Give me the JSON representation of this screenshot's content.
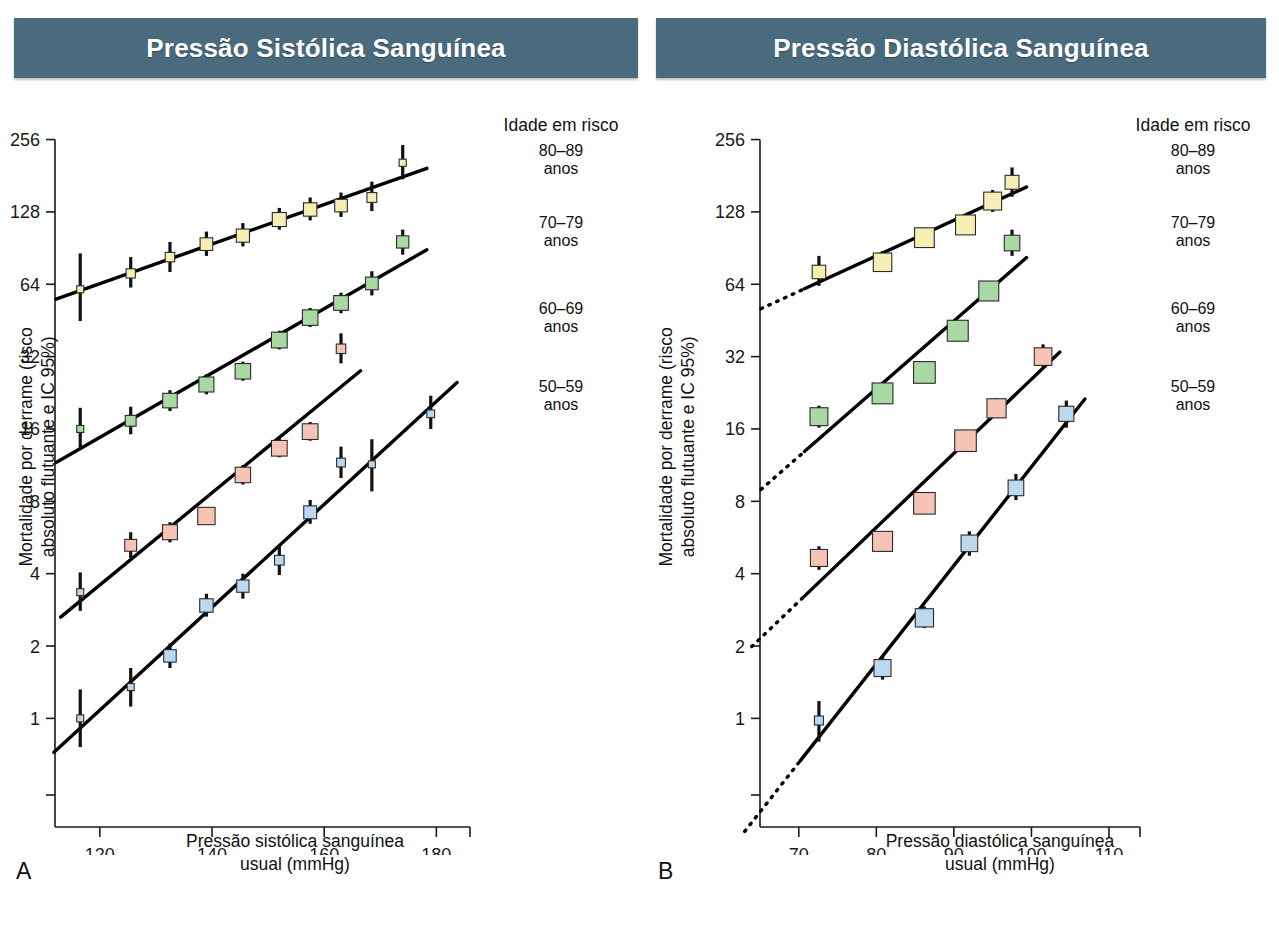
{
  "figure": {
    "panels": [
      {
        "id": "A",
        "letter": "A",
        "banner_title": "Pressão Sistólica Sanguínea",
        "xlabel_line1": "Pressão sistólica sanguínea",
        "xlabel_line2": "usual (mmHg)",
        "ylabel_line1": "Mortalidade por derrame (risco",
        "ylabel_line2": "absoluto flutuante e IC 95%)"
      },
      {
        "id": "B",
        "letter": "B",
        "banner_title": "Pressão Diastólica Sanguínea",
        "xlabel_line1": "Pressão diastólica sanguínea",
        "xlabel_line2": "usual (mmHg)",
        "ylabel_line1": "Mortalidade por derrame (risco",
        "ylabel_line2": "absoluto flutuante e IC 95%)"
      }
    ],
    "legend": {
      "title": "Idade em risco",
      "entries": [
        {
          "range": "80–89",
          "unit": "anos"
        },
        {
          "range": "70–79",
          "unit": "anos"
        },
        {
          "range": "60–69",
          "unit": "anos"
        },
        {
          "range": "50–59",
          "unit": "anos"
        }
      ]
    },
    "colors": {
      "banner": "#4a6a7e",
      "banner_text": "#ffffff",
      "series_80_89": "#f7eeb4",
      "series_70_79": "#a9d9a2",
      "series_60_69": "#f6c4b4",
      "series_50_59": "#bcd8ef",
      "line": "#000000",
      "ci": "#111111",
      "axis": "#1a1a1a"
    },
    "caption_partial": ""
  },
  "chart_data": [
    {
      "type": "scatter",
      "panel": "A",
      "title": "Pressão Sistólica Sanguínea",
      "xlabel": "Pressão sistólica sanguínea usual (mmHg)",
      "ylabel": "Mortalidade por derrame (risco absoluto flutuante e IC 95%)",
      "yscale": "log2",
      "yticks": [
        1,
        2,
        4,
        8,
        16,
        32,
        64,
        128,
        256
      ],
      "ytick_labels": [
        "1",
        "2",
        "4",
        "8",
        "16",
        "32",
        "64",
        "128",
        "256"
      ],
      "xticks": [
        120,
        140,
        160,
        180
      ],
      "xtick_labels": [
        "120",
        "140",
        "160",
        "180"
      ],
      "xlim": [
        112,
        186
      ],
      "ylim": [
        0.48,
        300
      ],
      "grid": false,
      "legend_position": "right",
      "series": [
        {
          "name": "80–89 anos",
          "color": "#f7eeb4",
          "marker": "square",
          "points": [
            {
              "x": 116.5,
              "y": 61,
              "ci_low": 45,
              "ci_high": 86
            },
            {
              "x": 125.5,
              "y": 71,
              "ci_low": 62,
              "ci_high": 83
            },
            {
              "x": 132.5,
              "y": 83,
              "ci_low": 72,
              "ci_high": 96
            },
            {
              "x": 139.0,
              "y": 94,
              "ci_low": 84,
              "ci_high": 106
            },
            {
              "x": 145.5,
              "y": 102,
              "ci_low": 92,
              "ci_high": 115
            },
            {
              "x": 152.0,
              "y": 119,
              "ci_low": 108,
              "ci_high": 133
            },
            {
              "x": 157.5,
              "y": 131,
              "ci_low": 118,
              "ci_high": 147
            },
            {
              "x": 163.0,
              "y": 136,
              "ci_low": 122,
              "ci_high": 154
            },
            {
              "x": 168.5,
              "y": 147,
              "ci_low": 129,
              "ci_high": 171
            },
            {
              "x": 174.0,
              "y": 205,
              "ci_low": 175,
              "ci_high": 243
            }
          ]
        },
        {
          "name": "70–79 anos",
          "color": "#a9d9a2",
          "marker": "square",
          "points": [
            {
              "x": 116.5,
              "y": 16.0,
              "ci_low": 13.2,
              "ci_high": 19.6
            },
            {
              "x": 125.5,
              "y": 17.3,
              "ci_low": 15.2,
              "ci_high": 19.8
            },
            {
              "x": 132.5,
              "y": 21.0,
              "ci_low": 19.0,
              "ci_high": 23.2
            },
            {
              "x": 139.0,
              "y": 24.5,
              "ci_low": 22.3,
              "ci_high": 27.0
            },
            {
              "x": 145.5,
              "y": 27.8,
              "ci_low": 25.4,
              "ci_high": 30.5
            },
            {
              "x": 152.0,
              "y": 37.5,
              "ci_low": 34.3,
              "ci_high": 41.0
            },
            {
              "x": 157.5,
              "y": 46.5,
              "ci_low": 42.5,
              "ci_high": 51.0
            },
            {
              "x": 163.0,
              "y": 53.5,
              "ci_low": 48.5,
              "ci_high": 59.0
            },
            {
              "x": 168.5,
              "y": 64.5,
              "ci_low": 57.5,
              "ci_high": 72.5
            },
            {
              "x": 174.0,
              "y": 96.0,
              "ci_low": 85.0,
              "ci_high": 108.0
            }
          ]
        },
        {
          "name": "60–69 anos",
          "color": "#f6c4b4",
          "marker": "square",
          "points": [
            {
              "x": 116.5,
              "y": 3.35,
              "ci_low": 2.8,
              "ci_high": 4.05
            },
            {
              "x": 125.5,
              "y": 5.25,
              "ci_low": 4.65,
              "ci_high": 5.95
            },
            {
              "x": 132.5,
              "y": 5.95,
              "ci_low": 5.4,
              "ci_high": 6.55
            },
            {
              "x": 139.0,
              "y": 6.95,
              "ci_low": 6.45,
              "ci_high": 7.5
            },
            {
              "x": 145.5,
              "y": 10.3,
              "ci_low": 9.4,
              "ci_high": 11.3
            },
            {
              "x": 152.0,
              "y": 13.3,
              "ci_low": 12.2,
              "ci_high": 14.6
            },
            {
              "x": 157.5,
              "y": 15.6,
              "ci_low": 14.3,
              "ci_high": 17.1
            },
            {
              "x": 163.0,
              "y": 34.5,
              "ci_low": 30.0,
              "ci_high": 40.0
            }
          ]
        },
        {
          "name": "50–59 anos",
          "color": "#bcd8ef",
          "marker": "square",
          "points": [
            {
              "x": 116.5,
              "y": 1.0,
              "ci_low": 0.76,
              "ci_high": 1.32
            },
            {
              "x": 125.5,
              "y": 1.35,
              "ci_low": 1.12,
              "ci_high": 1.62
            },
            {
              "x": 132.5,
              "y": 1.82,
              "ci_low": 1.62,
              "ci_high": 2.05
            },
            {
              "x": 139.0,
              "y": 2.95,
              "ci_low": 2.65,
              "ci_high": 3.3
            },
            {
              "x": 145.5,
              "y": 3.55,
              "ci_low": 3.15,
              "ci_high": 4.0
            },
            {
              "x": 152.0,
              "y": 4.55,
              "ci_low": 3.95,
              "ci_high": 5.25
            },
            {
              "x": 157.5,
              "y": 7.2,
              "ci_low": 6.45,
              "ci_high": 8.1
            },
            {
              "x": 163.0,
              "y": 11.6,
              "ci_low": 10.0,
              "ci_high": 13.5
            },
            {
              "x": 168.5,
              "y": 11.4,
              "ci_low": 8.8,
              "ci_high": 14.5
            },
            {
              "x": 179.0,
              "y": 18.5,
              "ci_low": 16.0,
              "ci_high": 22.0
            }
          ]
        }
      ]
    },
    {
      "type": "scatter",
      "panel": "B",
      "title": "Pressão Diastólica Sanguínea",
      "xlabel": "Pressão diastólica sanguínea usual (mmHg)",
      "ylabel": "Mortalidade por derrame (risco absoluto flutuante e IC 95%)",
      "yscale": "log2",
      "yticks": [
        1,
        2,
        4,
        8,
        16,
        32,
        64,
        128,
        256
      ],
      "ytick_labels": [
        "1",
        "2",
        "4",
        "8",
        "16",
        "32",
        "64",
        "128",
        "256"
      ],
      "xticks": [
        70,
        80,
        90,
        100,
        110
      ],
      "xtick_labels": [
        "70",
        "80",
        "90",
        "100",
        "110"
      ],
      "xlim": [
        65,
        114
      ],
      "ylim": [
        0.48,
        300
      ],
      "grid": false,
      "legend_position": "right",
      "series": [
        {
          "name": "80–89 anos",
          "color": "#f7eeb4",
          "marker": "square",
          "points": [
            {
              "x": 72.6,
              "y": 72,
              "ci_low": 63,
              "ci_high": 84
            },
            {
              "x": 80.8,
              "y": 79,
              "ci_low": 72,
              "ci_high": 88
            },
            {
              "x": 86.2,
              "y": 100,
              "ci_low": 92,
              "ci_high": 110
            },
            {
              "x": 91.5,
              "y": 113,
              "ci_low": 104,
              "ci_high": 124
            },
            {
              "x": 95.0,
              "y": 142,
              "ci_low": 128,
              "ci_high": 158
            },
            {
              "x": 97.5,
              "y": 170,
              "ci_low": 148,
              "ci_high": 196
            }
          ]
        },
        {
          "name": "70–79 anos",
          "color": "#a9d9a2",
          "marker": "square",
          "points": [
            {
              "x": 72.6,
              "y": 18.0,
              "ci_low": 16.2,
              "ci_high": 20.0
            },
            {
              "x": 80.8,
              "y": 22.5,
              "ci_low": 20.8,
              "ci_high": 24.4
            },
            {
              "x": 86.2,
              "y": 27.5,
              "ci_low": 25.6,
              "ci_high": 29.6
            },
            {
              "x": 90.5,
              "y": 41.0,
              "ci_low": 38.0,
              "ci_high": 44.5
            },
            {
              "x": 94.5,
              "y": 60.0,
              "ci_low": 55.0,
              "ci_high": 65.5
            },
            {
              "x": 97.5,
              "y": 95.0,
              "ci_low": 84.0,
              "ci_high": 108.0
            }
          ]
        },
        {
          "name": "60–69 anos",
          "color": "#f6c4b4",
          "marker": "square",
          "points": [
            {
              "x": 72.6,
              "y": 4.65,
              "ci_low": 4.15,
              "ci_high": 5.2
            },
            {
              "x": 80.8,
              "y": 5.45,
              "ci_low": 5.0,
              "ci_high": 5.95
            },
            {
              "x": 86.2,
              "y": 7.85,
              "ci_low": 7.3,
              "ci_high": 8.45
            },
            {
              "x": 91.5,
              "y": 14.3,
              "ci_low": 13.3,
              "ci_high": 15.4
            },
            {
              "x": 95.5,
              "y": 19.5,
              "ci_low": 17.8,
              "ci_high": 21.5
            },
            {
              "x": 101.5,
              "y": 32.0,
              "ci_low": 29.0,
              "ci_high": 36.0
            }
          ]
        },
        {
          "name": "50–59 anos",
          "color": "#bcd8ef",
          "marker": "square",
          "points": [
            {
              "x": 72.6,
              "y": 0.98,
              "ci_low": 0.8,
              "ci_high": 1.18
            },
            {
              "x": 80.8,
              "y": 1.62,
              "ci_low": 1.45,
              "ci_high": 1.82
            },
            {
              "x": 86.2,
              "y": 2.62,
              "ci_low": 2.38,
              "ci_high": 2.92
            },
            {
              "x": 92.0,
              "y": 5.35,
              "ci_low": 4.75,
              "ci_high": 6.0
            },
            {
              "x": 98.0,
              "y": 9.1,
              "ci_low": 8.1,
              "ci_high": 10.4
            },
            {
              "x": 104.5,
              "y": 18.5,
              "ci_low": 16.2,
              "ci_high": 21.0
            }
          ]
        }
      ]
    }
  ]
}
